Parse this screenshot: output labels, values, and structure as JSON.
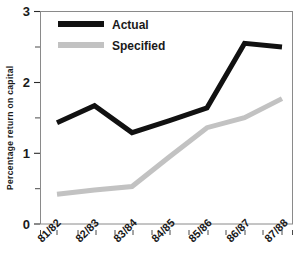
{
  "chart_data": {
    "type": "line",
    "title": "",
    "subtitle": "",
    "xlabel": "",
    "ylabel": "Percentage return on capital",
    "categories": [
      "81/82",
      "82/83",
      "83/84",
      "84/85",
      "85/86",
      "86/87",
      "87/88"
    ],
    "series": [
      {
        "name": "Actual",
        "color": "#111111",
        "values": [
          1.43,
          1.67,
          1.29,
          1.46,
          1.64,
          2.55,
          2.5
        ]
      },
      {
        "name": "Specified",
        "color": "#c2c2c2",
        "values": [
          0.42,
          0.48,
          0.53,
          0.95,
          1.36,
          1.5,
          1.77
        ]
      }
    ],
    "ylim": [
      0,
      3
    ],
    "yticks": [
      0,
      1,
      2,
      3
    ],
    "ytick_labels": [
      "0",
      "1",
      "2",
      "3"
    ],
    "yminor_ticks": [
      0.5,
      1.5,
      2.5
    ],
    "grid": false,
    "legend_position": "top-left"
  },
  "legend": {
    "entries": [
      {
        "label": "Actual"
      },
      {
        "label": "Specified"
      }
    ]
  },
  "axes": {
    "y_title": "Percentage return on capital"
  }
}
